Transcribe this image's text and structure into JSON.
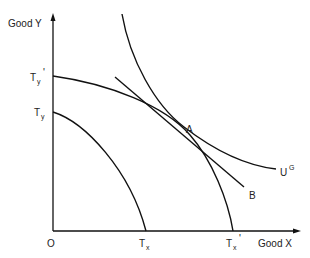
{
  "diagram": {
    "axes": {
      "y_label": "Good Y",
      "x_label": "Good X",
      "origin_label": "O"
    },
    "labels": {
      "ty_prime_main": "T",
      "ty_prime_sub": "y",
      "ty_prime_mark": "'",
      "ty_main": "T",
      "ty_sub": "y",
      "tx_main": "T",
      "tx_sub": "x",
      "tx_prime_main": "T",
      "tx_prime_sub": "x",
      "tx_prime_mark": "'",
      "point_a": "A",
      "point_b": "B",
      "indifference_main": "U",
      "indifference_sup": "G"
    },
    "curves": [
      {
        "name": "Transformation curve Ty-Tx",
        "from": "Ty",
        "to": "Tx"
      },
      {
        "name": "Transformation curve Ty'-Tx'",
        "from": "Ty'",
        "to": "Tx'"
      },
      {
        "name": "Indifference curve U^G",
        "tangent_at": "A"
      },
      {
        "name": "Price line through A to B"
      }
    ],
    "colors": {
      "ink": "#111111",
      "background": "#ffffff"
    }
  }
}
